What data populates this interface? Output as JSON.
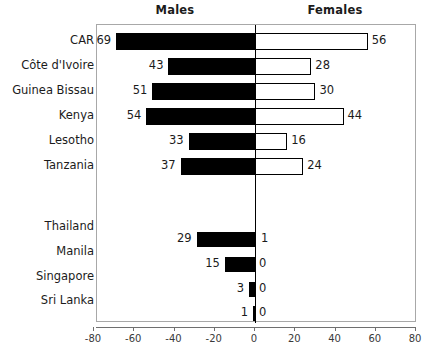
{
  "headers": {
    "left": "Males",
    "right": "Females"
  },
  "chart_data": {
    "type": "bar",
    "title": "",
    "subtitle": "",
    "xlabel": "",
    "ylabel": "",
    "orientation": "horizontal",
    "style": "diverging back-to-back bar chart",
    "xlim": [
      -80,
      80
    ],
    "xticks": [
      -80,
      -60,
      -40,
      -20,
      0,
      20,
      40,
      60,
      80
    ],
    "xtick_labels": [
      "-80",
      "-60",
      "-40",
      "-20",
      "0",
      "20",
      "40",
      "60",
      "80"
    ],
    "grid": false,
    "legend": "none",
    "series": [
      {
        "name": "Males",
        "plotted_sign": "negative",
        "fill": "#000000",
        "values": [
          69,
          43,
          51,
          54,
          33,
          37,
          29,
          15,
          3,
          1
        ]
      },
      {
        "name": "Females",
        "plotted_sign": "positive",
        "fill": "#ffffff",
        "values": [
          56,
          28,
          30,
          44,
          16,
          24,
          1,
          0,
          0,
          0
        ]
      }
    ],
    "categories": [
      "CAR",
      "Côte d'Ivoire",
      "Guinea Bissau",
      "Kenya",
      "Lesotho",
      "Tanzania",
      "Thailand",
      "Manila",
      "Singapore",
      "Sri Lanka"
    ],
    "groups": [
      {
        "name": "Africa",
        "categories": [
          "CAR",
          "Côte d'Ivoire",
          "Guinea Bissau",
          "Kenya",
          "Lesotho",
          "Tanzania"
        ]
      },
      {
        "name": "Asia",
        "categories": [
          "Thailand",
          "Manila",
          "Singapore",
          "Sri Lanka"
        ]
      }
    ],
    "rows": [
      {
        "category": "CAR",
        "male": 69,
        "female": 56,
        "male_label": "69",
        "female_label": "56"
      },
      {
        "category": "Côte d'Ivoire",
        "male": 43,
        "female": 28,
        "male_label": "43",
        "female_label": "28"
      },
      {
        "category": "Guinea Bissau",
        "male": 51,
        "female": 30,
        "male_label": "51",
        "female_label": "30"
      },
      {
        "category": "Kenya",
        "male": 54,
        "female": 44,
        "male_label": "54",
        "female_label": "44"
      },
      {
        "category": "Lesotho",
        "male": 33,
        "female": 16,
        "male_label": "33",
        "female_label": "16"
      },
      {
        "category": "Tanzania",
        "male": 37,
        "female": 24,
        "male_label": "37",
        "female_label": "24"
      },
      {
        "category": "Thailand",
        "male": 29,
        "female": 1,
        "male_label": "29",
        "female_label": "1"
      },
      {
        "category": "Manila",
        "male": 15,
        "female": 0,
        "male_label": "15",
        "female_label": "0"
      },
      {
        "category": "Singapore",
        "male": 3,
        "female": 0,
        "male_label": "3",
        "female_label": "0"
      },
      {
        "category": "Sri Lanka",
        "male": 1,
        "female": 0,
        "male_label": "1",
        "female_label": "0"
      }
    ]
  },
  "colors": {
    "male_bar": "#000000",
    "female_bar": "#ffffff",
    "bar_outline": "#000000",
    "frame": "#a8a8a8",
    "axis": "#6f6f6f",
    "text": "#1b1b1b"
  }
}
